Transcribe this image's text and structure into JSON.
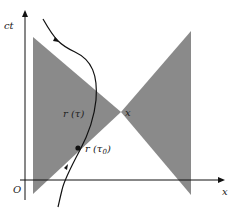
{
  "diagram": {
    "axes": {
      "vertical_label": "ct",
      "horizontal_label": "x",
      "origin_label": "O"
    },
    "labels": {
      "event": "x",
      "r_tau_prefix": "r",
      "r_tau": "(τ)",
      "r_tau0_prefix": "r",
      "r_tau0": "(τ",
      "r_tau0_sub": "0",
      "r_tau0_close": ")"
    },
    "colors": {
      "cone_fill": "#8a8a8a",
      "line": "#111111",
      "background": "#ffffff"
    }
  }
}
